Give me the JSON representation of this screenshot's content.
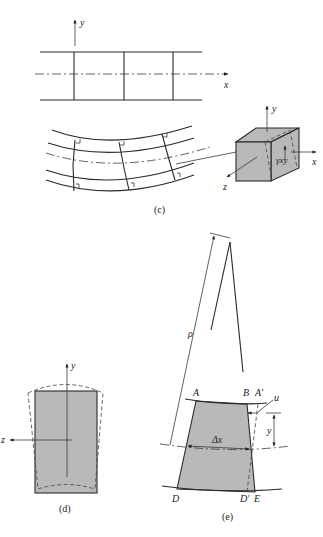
{
  "panel_c": {
    "caption": "(c)",
    "straight_beam": {
      "y_axis_label": "y",
      "x_axis_label": "x"
    },
    "element_cube": {
      "y_axis_label": "y",
      "x_axis_label": "x",
      "z_axis_label": "z",
      "shear_strain_label": "γxy"
    }
  },
  "panel_d": {
    "caption": "(d)",
    "y_axis_label": "y",
    "z_axis_label": "z"
  },
  "panel_e": {
    "caption": "(e)",
    "radius_label": "ρ",
    "point_labels": {
      "A": "A",
      "B": "B",
      "A_prime": "A′",
      "D": "D",
      "D_prime": "D′",
      "E": "E"
    },
    "displacement_label": "u",
    "height_label": "y",
    "length_label": "Δx"
  },
  "colors": {
    "shade": "#b9b9b9",
    "ink": "#2a2a2a",
    "background": "#ffffff"
  }
}
